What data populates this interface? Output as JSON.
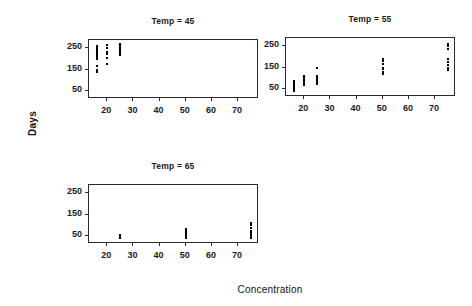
{
  "chart_data": {
    "type": "scatter",
    "title": "",
    "xlabel": "Concentration",
    "ylabel": "Days",
    "xlim": [
      13,
      78
    ],
    "ylim": [
      10,
      290
    ],
    "xticks": [
      20,
      30,
      40,
      50,
      60,
      70
    ],
    "yticks": [
      50,
      150,
      250
    ],
    "grid": false,
    "legend": "none",
    "conditioning_variable": "Temp",
    "panel_layout": "3 panels: two in top row, one in bottom-left row",
    "panels": [
      {
        "label": "Temp = 45",
        "temp": 45,
        "position": "top-left",
        "points": [
          {
            "x": 16,
            "y": 262
          },
          {
            "x": 16,
            "y": 255
          },
          {
            "x": 16,
            "y": 248
          },
          {
            "x": 16,
            "y": 240
          },
          {
            "x": 16,
            "y": 232
          },
          {
            "x": 16,
            "y": 224
          },
          {
            "x": 16,
            "y": 216
          },
          {
            "x": 16,
            "y": 208
          },
          {
            "x": 16,
            "y": 200
          },
          {
            "x": 16,
            "y": 168
          },
          {
            "x": 16,
            "y": 150
          },
          {
            "x": 16,
            "y": 140
          },
          {
            "x": 20,
            "y": 265
          },
          {
            "x": 20,
            "y": 250
          },
          {
            "x": 20,
            "y": 232
          },
          {
            "x": 20,
            "y": 222
          },
          {
            "x": 20,
            "y": 205
          },
          {
            "x": 20,
            "y": 178
          },
          {
            "x": 25,
            "y": 272
          },
          {
            "x": 25,
            "y": 265
          },
          {
            "x": 25,
            "y": 258
          },
          {
            "x": 25,
            "y": 250
          },
          {
            "x": 25,
            "y": 242
          },
          {
            "x": 25,
            "y": 234
          },
          {
            "x": 25,
            "y": 226
          },
          {
            "x": 25,
            "y": 218
          }
        ]
      },
      {
        "label": "Temp = 55",
        "temp": 55,
        "position": "top-right",
        "points": [
          {
            "x": 16,
            "y": 88
          },
          {
            "x": 16,
            "y": 80
          },
          {
            "x": 16,
            "y": 72
          },
          {
            "x": 16,
            "y": 64
          },
          {
            "x": 16,
            "y": 56
          },
          {
            "x": 16,
            "y": 48
          },
          {
            "x": 16,
            "y": 40
          },
          {
            "x": 20,
            "y": 108
          },
          {
            "x": 20,
            "y": 100
          },
          {
            "x": 20,
            "y": 92
          },
          {
            "x": 20,
            "y": 84
          },
          {
            "x": 20,
            "y": 76
          },
          {
            "x": 20,
            "y": 68
          },
          {
            "x": 25,
            "y": 150
          },
          {
            "x": 25,
            "y": 112
          },
          {
            "x": 25,
            "y": 104
          },
          {
            "x": 25,
            "y": 96
          },
          {
            "x": 25,
            "y": 88
          },
          {
            "x": 25,
            "y": 80
          },
          {
            "x": 25,
            "y": 72
          },
          {
            "x": 50,
            "y": 190
          },
          {
            "x": 50,
            "y": 182
          },
          {
            "x": 50,
            "y": 168
          },
          {
            "x": 50,
            "y": 150
          },
          {
            "x": 50,
            "y": 142
          },
          {
            "x": 50,
            "y": 128
          },
          {
            "x": 50,
            "y": 120
          },
          {
            "x": 75,
            "y": 262
          },
          {
            "x": 75,
            "y": 254
          },
          {
            "x": 75,
            "y": 240
          },
          {
            "x": 75,
            "y": 190
          },
          {
            "x": 75,
            "y": 178
          },
          {
            "x": 75,
            "y": 162
          },
          {
            "x": 75,
            "y": 150
          },
          {
            "x": 75,
            "y": 140
          }
        ]
      },
      {
        "label": "Temp = 65",
        "temp": 65,
        "position": "bottom-left",
        "points": [
          {
            "x": 25,
            "y": 52
          },
          {
            "x": 25,
            "y": 46
          },
          {
            "x": 25,
            "y": 40
          },
          {
            "x": 50,
            "y": 80
          },
          {
            "x": 50,
            "y": 72
          },
          {
            "x": 50,
            "y": 64
          },
          {
            "x": 50,
            "y": 56
          },
          {
            "x": 50,
            "y": 48
          },
          {
            "x": 50,
            "y": 40
          },
          {
            "x": 75,
            "y": 112
          },
          {
            "x": 75,
            "y": 100
          },
          {
            "x": 75,
            "y": 88
          },
          {
            "x": 75,
            "y": 72
          },
          {
            "x": 75,
            "y": 64
          },
          {
            "x": 75,
            "y": 56
          },
          {
            "x": 75,
            "y": 48
          },
          {
            "x": 75,
            "y": 40
          }
        ]
      }
    ]
  }
}
